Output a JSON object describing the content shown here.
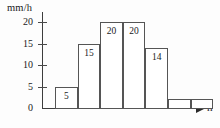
{
  "chart_data": {
    "type": "bar",
    "title": "",
    "xlabel": "h",
    "ylabel": "mm/h",
    "categories": [
      "1",
      "2",
      "3",
      "4",
      "5",
      "6",
      "7"
    ],
    "values": [
      5,
      15,
      20,
      20,
      14,
      2,
      2
    ],
    "bar_labels": [
      "5",
      "15",
      "20",
      "20",
      "14",
      "",
      ""
    ],
    "yticks": [
      "0",
      "5",
      "10",
      "15",
      "20"
    ],
    "ytick_values": [
      0,
      5,
      10,
      15,
      20
    ],
    "ylim": [
      0,
      22
    ],
    "grid": false,
    "legend": null,
    "axis_color": "#3d3d3d",
    "bar_edge_color": "#555555",
    "bar_fill_color": "#ffffff",
    "text_color": "#1a1a1a"
  },
  "axes": {
    "y_unit": "mm/h",
    "x_unit": "h"
  }
}
